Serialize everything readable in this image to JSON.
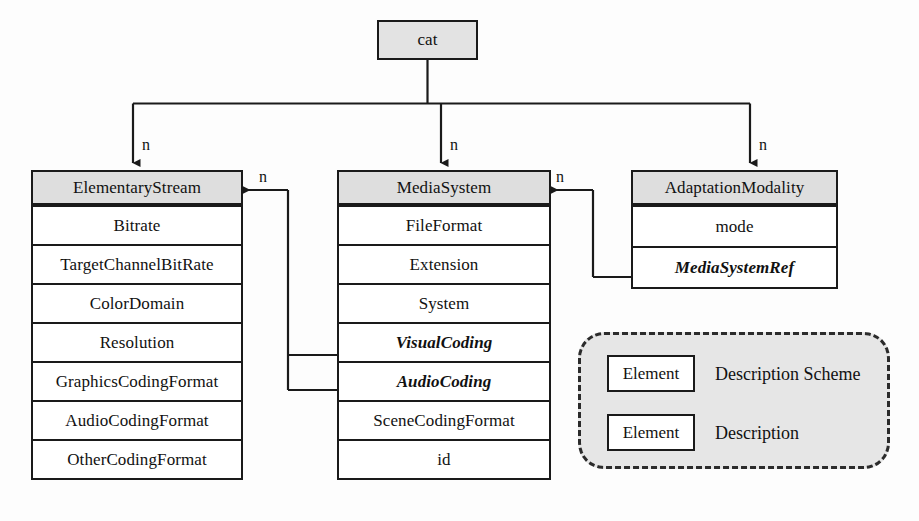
{
  "diagram": {
    "type": "uml-class-diagram",
    "root": {
      "label": "cat"
    },
    "classes": [
      {
        "id": "elementary-stream",
        "header": "ElementaryStream",
        "multiplicity": "n",
        "attributes": [
          {
            "label": "Bitrate",
            "italic": false
          },
          {
            "label": "TargetChannelBitRate",
            "italic": false
          },
          {
            "label": "ColorDomain",
            "italic": false
          },
          {
            "label": "Resolution",
            "italic": false
          },
          {
            "label": "GraphicsCodingFormat",
            "italic": false
          },
          {
            "label": "AudioCodingFormat",
            "italic": false
          },
          {
            "label": "OtherCodingFormat",
            "italic": false
          }
        ]
      },
      {
        "id": "media-system",
        "header": "MediaSystem",
        "multiplicity": "n",
        "attributes": [
          {
            "label": "FileFormat",
            "italic": false
          },
          {
            "label": "Extension",
            "italic": false
          },
          {
            "label": "System",
            "italic": false
          },
          {
            "label": "VisualCoding",
            "italic": true
          },
          {
            "label": "AudioCoding",
            "italic": true
          },
          {
            "label": "SceneCodingFormat",
            "italic": false
          },
          {
            "label": "id",
            "italic": false
          }
        ]
      },
      {
        "id": "adaptation-modality",
        "header": "AdaptationModality",
        "multiplicity": "n",
        "attributes": [
          {
            "label": "mode",
            "italic": false
          },
          {
            "label": "MediaSystemRef",
            "italic": true
          }
        ]
      }
    ],
    "reference_links": [
      {
        "id": "mediasystem-to-elementarystream",
        "from": "media-system",
        "to": "elementary-stream",
        "multiplicity": "n"
      },
      {
        "id": "adaptationmodality-to-mediasystem",
        "from": "adaptation-modality",
        "to": "media-system",
        "multiplicity": "n"
      }
    ],
    "legend": {
      "entries": [
        {
          "swatch_label": "Element",
          "description": "Description Scheme"
        },
        {
          "swatch_label": "Element",
          "description": "Description"
        }
      ]
    },
    "colors": {
      "header_fill": "#dedede",
      "root_fill": "#e3e3e3",
      "legend_fill": "#e6e6e6",
      "stroke": "#1a1a1a",
      "body_fill": "#ffffff"
    }
  }
}
